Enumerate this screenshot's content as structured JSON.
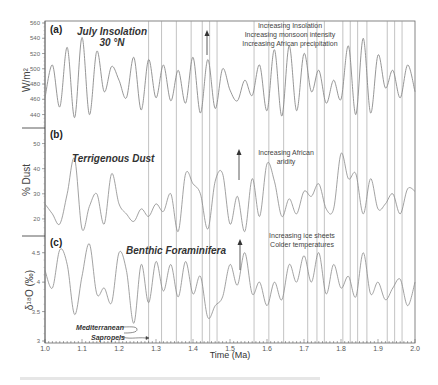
{
  "chart_data": [
    {
      "type": "line",
      "panel": "(a)",
      "title": "July Insolation 30 °N",
      "ylabel": "W/m²",
      "yticks": [
        440,
        460,
        480,
        500,
        520,
        540,
        560
      ],
      "ylim": [
        425,
        560
      ],
      "xlabel": "Time (Ma)",
      "xlim": [
        1.0,
        2.0
      ],
      "annotation": [
        "Increasing Insolation",
        "Increasing monsoon intensity",
        "Increasing African precipitation"
      ],
      "x": [
        1.0,
        1.02,
        1.04,
        1.06,
        1.08,
        1.1,
        1.12,
        1.14,
        1.16,
        1.18,
        1.2,
        1.22,
        1.24,
        1.26,
        1.28,
        1.3,
        1.32,
        1.34,
        1.36,
        1.38,
        1.4,
        1.42,
        1.44,
        1.46,
        1.48,
        1.5,
        1.52,
        1.54,
        1.56,
        1.58,
        1.6,
        1.62,
        1.64,
        1.66,
        1.68,
        1.7,
        1.72,
        1.74,
        1.76,
        1.78,
        1.8,
        1.82,
        1.84,
        1.86,
        1.88,
        1.9,
        1.92,
        1.94,
        1.96,
        1.98,
        2.0
      ],
      "values": [
        462,
        505,
        450,
        528,
        436,
        541,
        440,
        523,
        470,
        503,
        485,
        462,
        515,
        446,
        512,
        462,
        505,
        458,
        498,
        455,
        515,
        442,
        512,
        448,
        500,
        472,
        458,
        485,
        465,
        505,
        445,
        525,
        438,
        530,
        445,
        520,
        470,
        498,
        455,
        485,
        460,
        530,
        440,
        540,
        442,
        518,
        475,
        498,
        462,
        505,
        470
      ]
    },
    {
      "type": "line",
      "panel": "(b)",
      "title": "Terrigenous Dust",
      "ylabel": "% Dust",
      "yticks": [
        20,
        30,
        40,
        50
      ],
      "ylim": [
        14,
        55
      ],
      "xlim": [
        1.0,
        2.0
      ],
      "annotation": [
        "Increasing African",
        "aridity"
      ],
      "x": [
        1.0,
        1.02,
        1.04,
        1.06,
        1.08,
        1.1,
        1.12,
        1.14,
        1.16,
        1.18,
        1.2,
        1.22,
        1.24,
        1.26,
        1.28,
        1.3,
        1.32,
        1.34,
        1.36,
        1.38,
        1.4,
        1.42,
        1.44,
        1.46,
        1.48,
        1.5,
        1.52,
        1.54,
        1.56,
        1.58,
        1.6,
        1.62,
        1.64,
        1.66,
        1.68,
        1.7,
        1.72,
        1.74,
        1.76,
        1.78,
        1.8,
        1.82,
        1.84,
        1.86,
        1.88,
        1.9,
        1.92,
        1.94,
        1.96,
        1.98,
        2.0
      ],
      "values": [
        26,
        22,
        18,
        30,
        44,
        16,
        25,
        30,
        18,
        38,
        26,
        22,
        19,
        24,
        21,
        26,
        23,
        30,
        15,
        38,
        34,
        30,
        16,
        35,
        38,
        18,
        29,
        15,
        36,
        21,
        42,
        35,
        21,
        28,
        22,
        31,
        29,
        34,
        24,
        24,
        46,
        36,
        38,
        22,
        36,
        24,
        26,
        30,
        22,
        32,
        31
      ]
    },
    {
      "type": "line",
      "panel": "(c)",
      "title": "Benthic Foraminifera",
      "ylabel": "δ18O (‰)",
      "yticks": [
        3,
        3.5,
        4,
        4.5
      ],
      "ylim": [
        3.0,
        4.75
      ],
      "xlim": [
        1.0,
        2.0
      ],
      "annotation": [
        "Increasing ice sheets",
        "Colder temperatures"
      ],
      "side_label": [
        "Mediterranean",
        "Sapropels"
      ],
      "x": [
        1.0,
        1.02,
        1.04,
        1.06,
        1.08,
        1.1,
        1.12,
        1.14,
        1.16,
        1.18,
        1.2,
        1.22,
        1.24,
        1.26,
        1.28,
        1.3,
        1.32,
        1.34,
        1.36,
        1.38,
        1.4,
        1.42,
        1.44,
        1.46,
        1.48,
        1.5,
        1.52,
        1.54,
        1.56,
        1.58,
        1.6,
        1.62,
        1.64,
        1.66,
        1.68,
        1.7,
        1.72,
        1.74,
        1.76,
        1.78,
        1.8,
        1.82,
        1.84,
        1.86,
        1.88,
        1.9,
        1.92,
        1.94,
        1.96,
        1.98,
        2.0
      ],
      "values": [
        4.2,
        3.9,
        4.55,
        4.3,
        3.45,
        4.1,
        4.65,
        3.8,
        3.9,
        3.65,
        4.5,
        4.2,
        3.3,
        4.3,
        3.65,
        4.35,
        3.85,
        4.3,
        3.75,
        4.35,
        3.8,
        4.1,
        3.4,
        3.6,
        3.75,
        4.3,
        3.95,
        4.5,
        3.8,
        4.0,
        3.6,
        4.0,
        3.7,
        4.3,
        4.0,
        4.45,
        4.0,
        4.5,
        3.8,
        4.3,
        3.9,
        4.1,
        3.75,
        4.5,
        3.8,
        4.0,
        3.7,
        3.9,
        4.05,
        3.6,
        4.0
      ]
    }
  ],
  "figure": {
    "xlabel": "Time (Ma)",
    "xticks": [
      "1.0",
      "1.1",
      "1.2",
      "1.3",
      "1.4",
      "1.5",
      "1.6",
      "1.7",
      "1.8",
      "1.9",
      "2.0"
    ],
    "vertical_lines_ma": [
      1.28,
      1.315,
      1.355,
      1.395,
      1.425,
      1.445,
      1.465,
      1.565,
      1.605,
      1.645,
      1.71,
      1.735,
      1.755,
      1.805,
      1.825,
      1.845,
      1.87,
      1.925,
      1.945,
      1.965
    ],
    "line_color": "#8a8a8a",
    "caption": "Figure caption (blurred, illegible)"
  },
  "labels": {
    "a_letter": "(a)",
    "a_title1": "July Insolation",
    "a_title2": "30 °N",
    "a_ylabel": "W/m²",
    "a_annot1": "Increasing Insolation",
    "a_annot2": "Increasing monsoon intensity",
    "a_annot3": "Increasing African precipitation",
    "b_letter": "(b)",
    "b_title": "Terrigenous Dust",
    "b_ylabel": "% Dust",
    "b_annot1": "Increasing African",
    "b_annot2": "aridity",
    "c_letter": "(c)",
    "c_title": "Benthic Foraminifera",
    "c_ylabel": "δ¹⁸O (‰)",
    "c_annot1": "Increasing ice sheets",
    "c_annot2": "Colder temperatures",
    "sap1": "Mediterranean",
    "sap2": "Sapropels",
    "xlabel": "Time (Ma)",
    "a_yt": [
      "440",
      "460",
      "480",
      "500",
      "520",
      "540",
      "560"
    ],
    "b_yt": [
      "20",
      "30",
      "40",
      "50"
    ],
    "c_yt": [
      "3",
      "3.5",
      "4",
      "4.5"
    ],
    "xt": [
      "1.0",
      "1.1",
      "1.2",
      "1.3",
      "1.4",
      "1.5",
      "1.6",
      "1.7",
      "1.8",
      "1.9",
      "2.0"
    ]
  }
}
